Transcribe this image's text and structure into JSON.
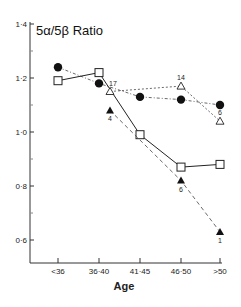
{
  "chart_data": {
    "type": "line",
    "title": "5α/5β Ratio",
    "xlabel": "Age",
    "ylabel": "5α/5β Ratio",
    "categories": [
      "<36",
      "36-40",
      "41-45",
      "46-50",
      ">50"
    ],
    "ylim": [
      0.5,
      1.4
    ],
    "yticks": [
      0.6,
      0.8,
      1.0,
      1.2,
      1.4
    ],
    "ytick_labels": [
      "0·6",
      "0·8",
      "1·0",
      "1·2",
      "1·4"
    ],
    "xtick_labels": [
      "<36",
      "36·40",
      "41·45",
      "46·50",
      ">50"
    ],
    "grid": false,
    "legend": null,
    "series": [
      {
        "name": "filled circles",
        "marker": "filled-circle",
        "line": "dash-dot",
        "values": [
          1.24,
          1.18,
          1.13,
          1.12,
          1.1
        ]
      },
      {
        "name": "open squares",
        "marker": "open-square",
        "line": "solid",
        "values": [
          1.19,
          1.22,
          0.99,
          0.87,
          0.88
        ]
      },
      {
        "name": "open triangles",
        "marker": "open-triangle",
        "line": "dotted",
        "values": [
          null,
          1.15,
          null,
          1.17,
          1.04
        ],
        "annotations": [
          null,
          "17",
          null,
          "14",
          "6"
        ]
      },
      {
        "name": "filled triangles",
        "marker": "filled-triangle",
        "line": "dashed",
        "values": [
          null,
          1.08,
          null,
          0.82,
          0.63
        ],
        "annotations": [
          null,
          "4",
          null,
          "6",
          "1"
        ]
      }
    ]
  }
}
